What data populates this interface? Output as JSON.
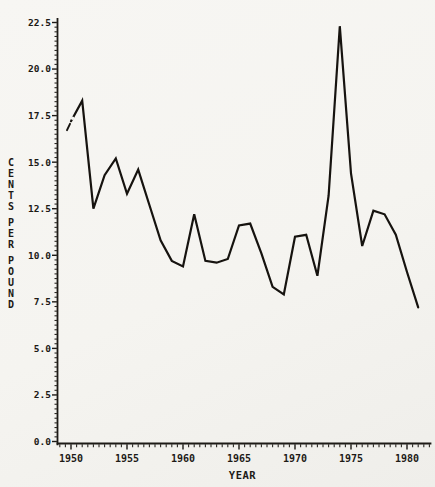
{
  "figure": {
    "background": "#f5f4f0",
    "ink": "#1d1a16",
    "line_color": "#16130f"
  },
  "chart_data": {
    "type": "line",
    "title": "",
    "xlabel": "YEAR",
    "ylabel": "CENTS PER POUND",
    "grid": false,
    "legend": null,
    "xlim": [
      1948.8,
      1982.2
    ],
    "ylim": [
      0,
      22.65
    ],
    "x_major_ticks": [
      1950,
      1955,
      1960,
      1965,
      1970,
      1975,
      1980
    ],
    "x_tick_labels": [
      "1950",
      "1955",
      "1960",
      "1965",
      "1970",
      "1975",
      "1980"
    ],
    "x_minor_step": 0.5,
    "y_major_ticks": [
      0,
      2.5,
      5,
      7.5,
      10,
      12.5,
      15,
      17.5,
      20,
      22.5
    ],
    "y_tick_labels": [
      "0.0",
      "2.5",
      "5.0",
      "7.5",
      "10.0",
      "12.5",
      "15.0",
      "17.5",
      "20.0",
      "22.5"
    ],
    "y_minor_step": 0.25,
    "series": [
      {
        "name": "cents-per-pound",
        "x": [
          1950,
          1951,
          1952,
          1953,
          1954,
          1955,
          1956,
          1957,
          1958,
          1959,
          1960,
          1961,
          1962,
          1963,
          1964,
          1965,
          1966,
          1967,
          1968,
          1969,
          1970,
          1971,
          1972,
          1973,
          1974,
          1975,
          1976,
          1977,
          1978,
          1979,
          1980,
          1981
        ],
        "values": [
          17.2,
          18.3,
          12.5,
          14.3,
          15.2,
          13.3,
          14.6,
          12.7,
          10.8,
          9.7,
          9.4,
          12.2,
          9.7,
          9.6,
          9.8,
          11.6,
          11.7,
          10.1,
          8.3,
          7.9,
          11.0,
          11.1,
          8.9,
          13.2,
          22.3,
          14.4,
          10.5,
          12.4,
          12.2,
          11.1,
          9.1,
          7.2
        ]
      }
    ]
  }
}
